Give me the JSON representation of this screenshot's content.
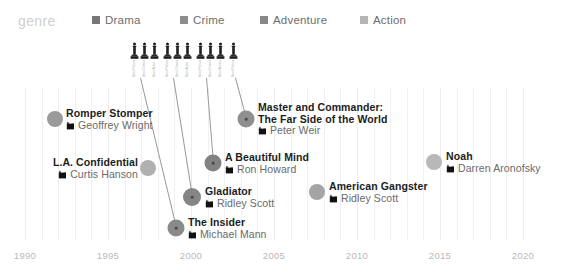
{
  "legend": {
    "title": "genre",
    "items": [
      {
        "label": "Drama",
        "color": "#777777",
        "x": 0
      },
      {
        "label": "Crime",
        "color": "#8d8d8d",
        "x": 88
      },
      {
        "label": "Adventure",
        "color": "#888888",
        "x": 168
      },
      {
        "label": "Action",
        "color": "#b5b5b5",
        "x": 268
      }
    ]
  },
  "chart_data": {
    "type": "scatter",
    "title": "genre",
    "xlabel": "",
    "ylabel": "",
    "xlim": [
      1990,
      2020
    ],
    "grid": true,
    "legend_position": "top",
    "x_ticks": [
      {
        "label": "1990",
        "px": 25
      },
      {
        "label": "1995",
        "px": 108
      },
      {
        "label": "2000",
        "px": 191
      },
      {
        "label": "2005",
        "px": 274
      },
      {
        "label": "2010",
        "px": 357
      },
      {
        "label": "2015",
        "px": 440
      },
      {
        "label": "2020",
        "px": 523
      }
    ],
    "series": [
      {
        "name": "Romper Stomper",
        "director": "Geoffrey Wright",
        "year": 1992,
        "genre": "Crime",
        "color": "#9a9a9a",
        "radius": 8,
        "awards": 0,
        "cx": 55,
        "cy": 119,
        "label_side": "right",
        "label_x": 66,
        "label_y": 108,
        "title_lines": [
          "Romper Stomper"
        ]
      },
      {
        "name": "L.A. Confidential",
        "director": "Curtis Hanson",
        "year": 1997,
        "genre": "Crime",
        "color": "#b0b0b0",
        "radius": 8,
        "awards": 0,
        "cx": 148,
        "cy": 168,
        "label_side": "left",
        "label_x": 138,
        "label_y": 157,
        "title_lines": [
          "L.A. Confidential"
        ]
      },
      {
        "name": "The Insider",
        "director": "Michael Mann",
        "year": 1999,
        "genre": "Drama",
        "color": "#8a8a8a",
        "radius": 8.5,
        "awards": 3,
        "cx": 176,
        "cy": 228,
        "label_side": "right",
        "label_x": 188,
        "label_y": 217,
        "title_lines": [
          "The Insider"
        ]
      },
      {
        "name": "Gladiator",
        "director": "Ridley Scott",
        "year": 2000,
        "genre": "Adventure",
        "color": "#858585",
        "radius": 9,
        "awards": 3,
        "cx": 192,
        "cy": 197,
        "label_side": "right",
        "label_x": 205,
        "label_y": 186,
        "title_lines": [
          "Gladiator"
        ]
      },
      {
        "name": "A Beautiful Mind",
        "director": "Ron Howard",
        "year": 2001,
        "genre": "Drama",
        "color": "#828282",
        "radius": 8.5,
        "awards": 3,
        "cx": 213,
        "cy": 163,
        "label_side": "right",
        "label_x": 225,
        "label_y": 152,
        "title_lines": [
          "A Beautiful Mind"
        ]
      },
      {
        "name": "Master and Commander: The Far Side of the World",
        "director": "Peter Weir",
        "year": 2003,
        "genre": "Adventure",
        "color": "#8f8f8f",
        "radius": 8.5,
        "awards": 1,
        "cx": 246,
        "cy": 119,
        "label_side": "right",
        "label_x": 258,
        "label_y": 102,
        "title_lines": [
          "Master and Commander:",
          "The Far Side of the World"
        ]
      },
      {
        "name": "American Gangster",
        "director": "Ridley Scott",
        "year": 2007,
        "genre": "Crime",
        "color": "#a5a5a5",
        "radius": 8,
        "awards": 0,
        "cx": 317,
        "cy": 192,
        "label_side": "right",
        "label_x": 329,
        "label_y": 181,
        "title_lines": [
          "American Gangster"
        ]
      },
      {
        "name": "Noah",
        "director": "Darren Aronofsky",
        "year": 2014,
        "genre": "Action",
        "color": "#b8b8b8",
        "radius": 8,
        "awards": 0,
        "cx": 434,
        "cy": 162,
        "label_side": "right",
        "label_x": 446,
        "label_y": 151,
        "title_lines": [
          "Noah"
        ]
      }
    ],
    "award_clusters": [
      {
        "movie": "The Insider",
        "x": 130,
        "y": 42,
        "awards": [
          {
            "category": "Best Picture"
          },
          {
            "category": "Best Director"
          },
          {
            "category": "Best Actor"
          }
        ],
        "leader_from_x": 140,
        "leader_from_y": 78,
        "leader_to_x": 176,
        "leader_to_y": 228
      },
      {
        "movie": "Gladiator",
        "x": 163,
        "y": 42,
        "awards": [
          {
            "category": "Best Picture"
          },
          {
            "category": "Best Director"
          },
          {
            "category": "Best Actor"
          }
        ],
        "leader_from_x": 173,
        "leader_from_y": 78,
        "leader_to_x": 192,
        "leader_to_y": 197
      },
      {
        "movie": "A Beautiful Mind",
        "x": 196,
        "y": 42,
        "awards": [
          {
            "category": "Best Picture"
          },
          {
            "category": "Best Director"
          },
          {
            "category": "Best Actress"
          }
        ],
        "leader_from_x": 206,
        "leader_from_y": 78,
        "leader_to_x": 213,
        "leader_to_y": 163
      },
      {
        "movie": "Master and Commander: The Far Side of the World",
        "x": 229,
        "y": 42,
        "awards": [
          {
            "category": "Best Picture"
          }
        ],
        "leader_from_x": 235,
        "leader_from_y": 78,
        "leader_to_x": 246,
        "leader_to_y": 119
      }
    ]
  }
}
